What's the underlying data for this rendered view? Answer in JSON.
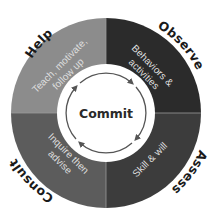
{
  "diagram": {
    "center": {
      "label": "Commit"
    },
    "quadrants": [
      {
        "id": "help",
        "position": "top-left",
        "outer_label": "Help",
        "inner_lines": [
          "Teach, motivate,",
          "follow up"
        ],
        "color": "#8c8c8c"
      },
      {
        "id": "observe",
        "position": "top-right",
        "outer_label": "Observe",
        "inner_lines": [
          "Behaviors &",
          "activities"
        ],
        "color": "#2b2b2b"
      },
      {
        "id": "assess",
        "position": "bottom-right",
        "outer_label": "Assess",
        "inner_lines": [
          "Skill & will"
        ],
        "color": "#3c3c3c"
      },
      {
        "id": "consult",
        "position": "bottom-left",
        "outer_label": "Consult",
        "inner_lines": [
          "Inquire then",
          "advise"
        ],
        "color": "#5c5c5c"
      }
    ],
    "cycle_direction": "clockwise"
  }
}
